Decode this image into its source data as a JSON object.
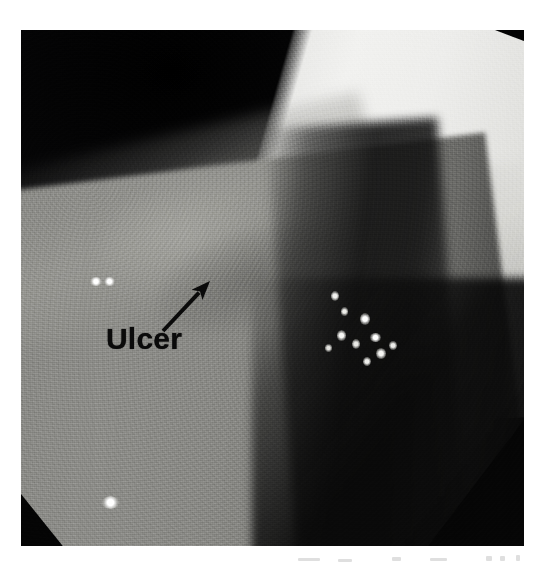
{
  "figure": {
    "kind": "endoscopic-photograph",
    "modality": "upper gastrointestinal endoscopy",
    "color_mode": "grayscale",
    "frame": {
      "x": 21,
      "y": 30,
      "width": 503,
      "height": 516
    },
    "page_background": "#ffffff"
  },
  "annotations": {
    "label": {
      "text": "Ulcer",
      "color": "#0a0a0a",
      "font_weight": "bold",
      "font_size_px": 30,
      "x": 106,
      "y": 324
    },
    "arrow": {
      "name": "ulcer-pointer-arrow",
      "color": "#0a0a0a",
      "tail_x": 163,
      "tail_y": 331,
      "tip_x": 210,
      "tip_y": 281,
      "shaft_width_px": 4,
      "head_length_px": 19,
      "head_width_px": 15,
      "points_to": "Ulcer"
    }
  },
  "regions": [
    {
      "name": "dark-lumen-field",
      "tone": "#0a0a0b",
      "description": "dark upper and peripheral vignette of the lumen"
    },
    {
      "name": "bright-illuminated-fold",
      "tone": "#f2f2f0",
      "description": "brightly lit mucosal fold running diagonally across the upper right"
    },
    {
      "name": "grey-mucosa-wall",
      "tone": "#8a8a86",
      "description": "mid-grey mucosal wall filling the lower left two thirds"
    },
    {
      "name": "ulcer-crater",
      "tone": "#acaca7",
      "description": "pale irregular ulcer crater indicated by the arrow"
    },
    {
      "name": "dark-trough",
      "tone": "#101010",
      "description": "shadowed trough separating mucosa from the bright fold"
    },
    {
      "name": "black-corner-bottom-left",
      "tone": "#040404",
      "description": "black triangular corner at the bottom left"
    },
    {
      "name": "black-corner-bottom-right",
      "tone": "#050505",
      "description": "black corner wedge at the bottom right"
    },
    {
      "name": "black-corner-top-right",
      "tone": "#030303",
      "description": "black sliver above the bright fold"
    }
  ],
  "speculars": [
    {
      "name": "specular-left-pair-a",
      "x": 90,
      "y": 277,
      "w": 12,
      "h": 9,
      "intensity": "#ffffff"
    },
    {
      "name": "specular-left-pair-b",
      "x": 104,
      "y": 277,
      "w": 11,
      "h": 9,
      "intensity": "#ffffff"
    },
    {
      "name": "specular-lower-left",
      "x": 102,
      "y": 496,
      "w": 17,
      "h": 13,
      "intensity": "#ffffff"
    },
    {
      "name": "specular-cluster-1",
      "x": 331,
      "y": 291,
      "w": 8,
      "h": 10,
      "intensity": "#f4f4f1"
    },
    {
      "name": "specular-cluster-2",
      "x": 341,
      "y": 307,
      "w": 7,
      "h": 9,
      "intensity": "#eeeeea"
    },
    {
      "name": "specular-cluster-3",
      "x": 360,
      "y": 313,
      "w": 10,
      "h": 12,
      "intensity": "#ffffff"
    },
    {
      "name": "specular-cluster-4",
      "x": 337,
      "y": 330,
      "w": 9,
      "h": 11,
      "intensity": "#f8f8f5"
    },
    {
      "name": "specular-cluster-5",
      "x": 352,
      "y": 339,
      "w": 8,
      "h": 10,
      "intensity": "#eaeae6"
    },
    {
      "name": "specular-cluster-6",
      "x": 370,
      "y": 333,
      "w": 11,
      "h": 9,
      "intensity": "#ffffff"
    },
    {
      "name": "specular-cluster-7",
      "x": 376,
      "y": 348,
      "w": 10,
      "h": 11,
      "intensity": "#f6f6f3"
    },
    {
      "name": "specular-cluster-8",
      "x": 389,
      "y": 341,
      "w": 8,
      "h": 9,
      "intensity": "#ededea"
    },
    {
      "name": "specular-cluster-9",
      "x": 325,
      "y": 344,
      "w": 7,
      "h": 8,
      "intensity": "#e6e6e2"
    },
    {
      "name": "specular-cluster-10",
      "x": 363,
      "y": 357,
      "w": 8,
      "h": 9,
      "intensity": "#f0f0ed"
    }
  ],
  "scan_artifacts": [
    {
      "name": "artifact-mark-1",
      "x": 298,
      "y": 6,
      "w": 22,
      "h": 3
    },
    {
      "name": "artifact-mark-2",
      "x": 338,
      "y": 7,
      "w": 14,
      "h": 3
    },
    {
      "name": "artifact-mark-3",
      "x": 392,
      "y": 5,
      "w": 9,
      "h": 4
    },
    {
      "name": "artifact-mark-4",
      "x": 430,
      "y": 6,
      "w": 17,
      "h": 3
    },
    {
      "name": "artifact-mark-5",
      "x": 486,
      "y": 4,
      "w": 6,
      "h": 5
    },
    {
      "name": "artifact-mark-6",
      "x": 500,
      "y": 4,
      "w": 5,
      "h": 5
    },
    {
      "name": "artifact-mark-7",
      "x": 516,
      "y": 3,
      "w": 4,
      "h": 6
    }
  ]
}
